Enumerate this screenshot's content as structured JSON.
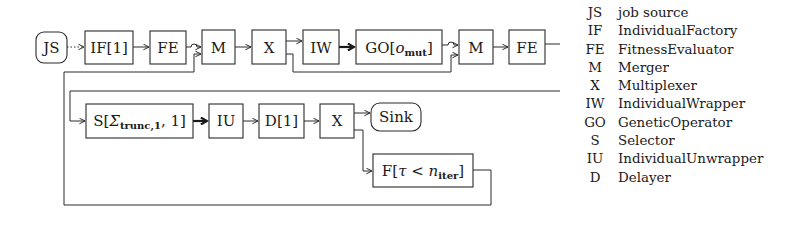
{
  "diagram": {
    "nodes": {
      "js": "JS",
      "if": "IF[1]",
      "fe1": "FE",
      "m1": "M",
      "x1": "X",
      "iw": "IW",
      "go_main": "GO[",
      "go_var": "o",
      "go_sub": "mut",
      "go_close": "]",
      "m2": "M",
      "fe2": "FE",
      "s_main": "S[",
      "s_var": "Σ",
      "s_sub": "trunc,1",
      "s_rest": ", 1]",
      "iu": "IU",
      "d": "D[1]",
      "x2": "X",
      "sink": "Sink",
      "f_main": "F[",
      "f_tau": "τ",
      "f_lt": " < ",
      "f_n": "n",
      "f_sub": "iter",
      "f_close": "]"
    },
    "edges": [
      {
        "from": "JS",
        "to": "IF[1]",
        "style": "dotted"
      },
      {
        "from": "IF[1]",
        "to": "FE",
        "style": "normal"
      },
      {
        "from": "FE",
        "to": "M",
        "style": "normal"
      },
      {
        "from": "M",
        "to": "X",
        "style": "normal"
      },
      {
        "from": "X",
        "to": "IW",
        "style": "normal"
      },
      {
        "from": "X",
        "to": "M (second)",
        "style": "normal"
      },
      {
        "from": "IW",
        "to": "GO[o_mut]",
        "style": "thick"
      },
      {
        "from": "GO[o_mut]",
        "to": "M (second)",
        "style": "normal"
      },
      {
        "from": "M (second)",
        "to": "FE (second)",
        "style": "normal"
      },
      {
        "from": "FE (second)",
        "to": "S[Σ_trunc,1, 1]",
        "style": "normal"
      },
      {
        "from": "S[Σ_trunc,1, 1]",
        "to": "IU",
        "style": "thick"
      },
      {
        "from": "IU",
        "to": "D[1]",
        "style": "normal"
      },
      {
        "from": "D[1]",
        "to": "X (second)",
        "style": "normal"
      },
      {
        "from": "X (second)",
        "to": "Sink",
        "style": "normal"
      },
      {
        "from": "X (second)",
        "to": "F[τ < n_iter]",
        "style": "normal"
      },
      {
        "from": "F[τ < n_iter]",
        "to": "M",
        "style": "normal"
      }
    ],
    "line_color": "#2a2a2a"
  },
  "legend": [
    {
      "abbr": "JS",
      "desc": "job source"
    },
    {
      "abbr": "IF",
      "desc": "IndividualFactory"
    },
    {
      "abbr": "FE",
      "desc": "FitnessEvaluator"
    },
    {
      "abbr": "M",
      "desc": "Merger"
    },
    {
      "abbr": "X",
      "desc": "Multiplexer"
    },
    {
      "abbr": "IW",
      "desc": "IndividualWrapper"
    },
    {
      "abbr": "GO",
      "desc": "GeneticOperator"
    },
    {
      "abbr": "S",
      "desc": "Selector"
    },
    {
      "abbr": "IU",
      "desc": "IndividualUnwrapper"
    },
    {
      "abbr": "D",
      "desc": "Delayer"
    }
  ]
}
